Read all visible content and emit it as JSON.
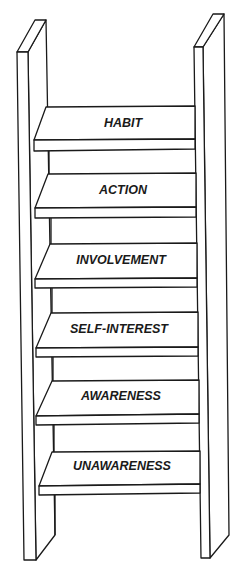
{
  "diagram": {
    "type": "ladder",
    "stroke_color": "#1a1a1a",
    "fill_color": "#ffffff",
    "rungs_top_to_bottom": [
      {
        "label": "HABIT"
      },
      {
        "label": "ACTION"
      },
      {
        "label": "INVOLVEMENT"
      },
      {
        "label": "SELF-INTEREST"
      },
      {
        "label": "AWARENESS"
      },
      {
        "label": "UNAWARENESS"
      }
    ]
  }
}
